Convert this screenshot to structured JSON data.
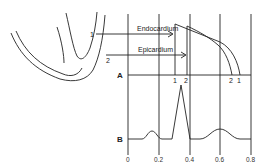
{
  "figure": {
    "labels": {
      "endocardium": "Endocardium",
      "epicardium": "Epicardium",
      "trace_a": "A",
      "trace_b": "B",
      "marker_1": "1",
      "marker_2": "2"
    },
    "x_axis": {
      "ticks": [
        "0",
        "0.2",
        "0.4",
        "0.6",
        "0.8"
      ]
    },
    "colors": {
      "line": "#222222",
      "background": "#ffffff"
    }
  }
}
